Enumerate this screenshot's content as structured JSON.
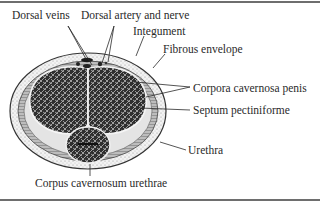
{
  "figure": {
    "type": "anatomical cross-section",
    "labels": {
      "dorsal_veins": "Dorsal veins",
      "dorsal_artery_nerve": "Dorsal artery and nerve",
      "integument": "Integument",
      "fibrous_envelope": "Fibrous envelope",
      "corpora_cavernosa_penis": "Corpora cavernosa penis",
      "septum_pectiniforme": "Septum pectiniforme",
      "urethra": "Urethra",
      "corpus_cavernosum_urethrae": "Corpus cavernosum urethrae"
    },
    "colors": {
      "ink": "#2a2a2a",
      "rule": "#6e6e6e",
      "tissue_dark": "#3a3a3a",
      "tissue_light": "#d8d8d8",
      "background": "#ffffff"
    }
  }
}
